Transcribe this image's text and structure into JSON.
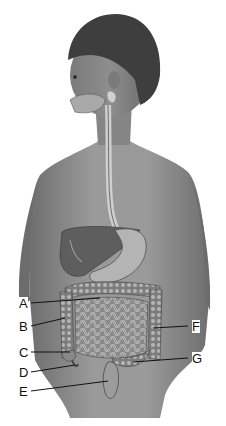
{
  "diagram": {
    "labels": [
      {
        "id": "A",
        "text": "A",
        "x": 19,
        "y": 297,
        "lx1": 31,
        "ly1": 303,
        "lx2": 100,
        "ly2": 298
      },
      {
        "id": "B",
        "text": "B",
        "x": 19,
        "y": 320,
        "lx1": 31,
        "ly1": 326,
        "lx2": 65,
        "ly2": 318
      },
      {
        "id": "C",
        "text": "C",
        "x": 19,
        "y": 346,
        "lx1": 31,
        "ly1": 352,
        "lx2": 70,
        "ly2": 352
      },
      {
        "id": "D",
        "text": "D",
        "x": 19,
        "y": 366,
        "lx1": 31,
        "ly1": 372,
        "lx2": 75,
        "ly2": 365
      },
      {
        "id": "E",
        "text": "E",
        "x": 19,
        "y": 385,
        "lx1": 31,
        "ly1": 391,
        "lx2": 108,
        "ly2": 381
      },
      {
        "id": "F",
        "text": "F",
        "x": 192,
        "y": 320,
        "lx1": 153,
        "ly1": 328,
        "lx2": 188,
        "ly2": 326
      },
      {
        "id": "G",
        "text": "G",
        "x": 192,
        "y": 352,
        "lx1": 133,
        "ly1": 362,
        "lx2": 188,
        "ly2": 358
      }
    ]
  },
  "colors": {
    "skin": "#8c8c8c",
    "skin_light": "#b0b0b0",
    "hair": "#3a3a3a",
    "organ_dark": "#5a5a5a",
    "organ_light": "#cfcfcf",
    "line": "#111111",
    "background": "#ffffff"
  }
}
